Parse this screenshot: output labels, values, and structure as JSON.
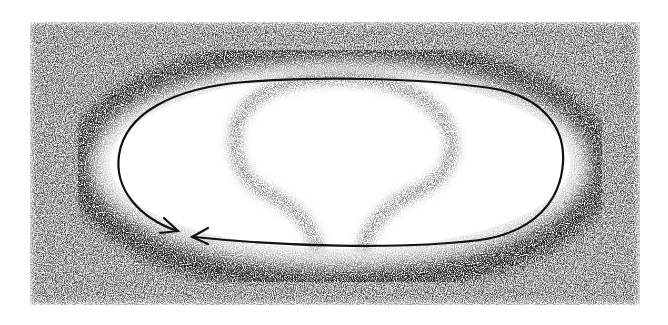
{
  "figure": {
    "background_color": "#ffffff",
    "shading_color": "#1a1a1a",
    "line_color": "#111111",
    "inner_figure_color": "#7a7a7a",
    "elements": [
      {
        "name": "shaded-field",
        "shape": "rectangle",
        "bounds": [
          30,
          22,
          640,
          305
        ]
      },
      {
        "name": "dark-ring",
        "shape": "ellipse-band",
        "center": [
          340,
          165
        ],
        "rx": 262,
        "ry": 118
      },
      {
        "name": "light-halo",
        "shape": "ellipse",
        "center": [
          340,
          163
        ],
        "rx": 245,
        "ry": 100
      },
      {
        "name": "loop-line",
        "shape": "racetrack-path",
        "arrows": 2
      },
      {
        "name": "keyhole-figure",
        "shape": "bulb-with-stem"
      }
    ],
    "arrows": [
      {
        "name": "arrow-left-descending",
        "tip": [
          178,
          231
        ]
      },
      {
        "name": "arrow-bottom-leftward",
        "tip": [
          192,
          237
        ]
      }
    ]
  }
}
